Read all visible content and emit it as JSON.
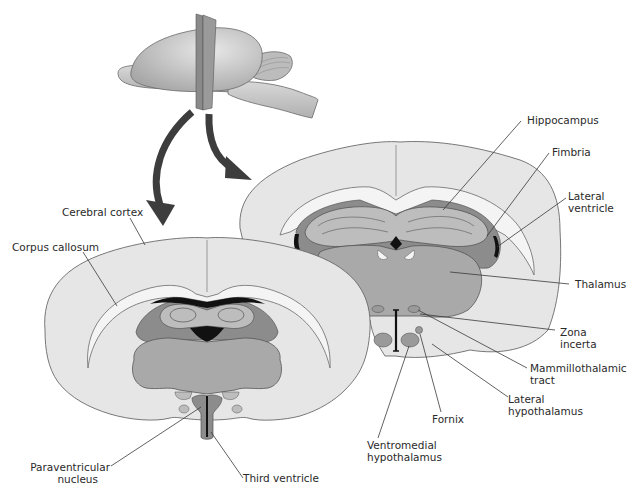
{
  "figure": {
    "type": "anatomical-diagram",
    "colors": {
      "background": "#ffffff",
      "tissue_light": "#e6e6e6",
      "tissue_outline": "#6a6a6a",
      "white_matter": "#f4f4f4",
      "thalamus": "#a9a9a9",
      "hippocampus": "#bdbdbd",
      "dark_region": "#8c8c8c",
      "ventricle": "#111111",
      "arrow": "#3d3d3d",
      "whole_brain": "#c4c4c4",
      "section_plane": "#7a7a7a"
    }
  },
  "labels": {
    "cerebral_cortex": "Cerebral cortex",
    "corpus_callosum": "Corpus callosum",
    "hippocampus": "Hippocampus",
    "fimbria": "Fimbria",
    "lateral_ventricle": [
      "Lateral",
      "ventricle"
    ],
    "thalamus": "Thalamus",
    "zona_incerta": [
      "Zona",
      "incerta"
    ],
    "mammillothalamic_tract": [
      "Mammillothalamic",
      "tract"
    ],
    "lateral_hypothalamus": [
      "Lateral",
      "hypothalamus"
    ],
    "fornix": "Fornix",
    "ventromedial_hypothalamus": [
      "Ventromedial",
      "hypothalamus"
    ],
    "paraventricular_nucleus": [
      "Paraventricular",
      "nucleus"
    ],
    "third_ventricle": "Third ventricle"
  }
}
